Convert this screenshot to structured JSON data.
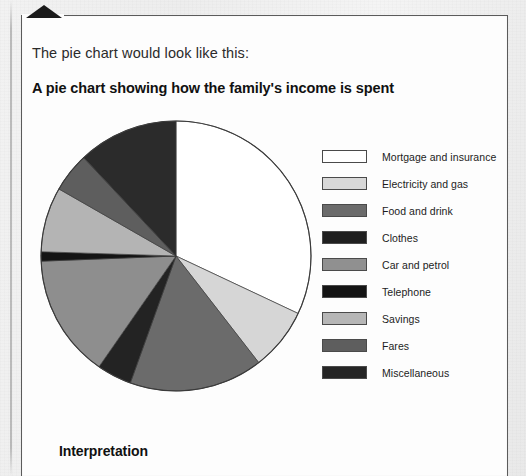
{
  "page": {
    "intro_line": "The pie chart would look like this:",
    "interpretation_heading": "Interpretation",
    "corner_marker": "page-corner-triangle",
    "ghost_text": [
      "a pie chart",
      "of the total",
      "to the size",
      "each sector",
      "the amounts",
      "is spent on",
      "given below"
    ]
  },
  "chart_data": {
    "type": "pie",
    "title": "A pie chart showing how the family's income is spent",
    "xlabel": "",
    "ylabel": "",
    "legend_position": "right",
    "grid": false,
    "start_angle_deg": 0,
    "direction": "clockwise",
    "categories": [
      "Mortgage and insurance",
      "Electricity and gas",
      "Food and drink",
      "Clothes",
      "Car and petrol",
      "Telephone",
      "Savings",
      "Fares",
      "Miscellaneous"
    ],
    "values": [
      32.0,
      7.5,
      16.0,
      4.2,
      14.7,
      1.1,
      7.8,
      4.7,
      12.0
    ],
    "units": "percent of income",
    "slices": [
      {
        "label": "Mortgage and insurance",
        "percent": 32.0,
        "angle_start_deg": 0,
        "angle_end_deg": 115.2,
        "color": "#ffffff"
      },
      {
        "label": "Electricity and gas",
        "percent": 7.5,
        "angle_start_deg": 115.2,
        "angle_end_deg": 142.2,
        "color": "#d6d6d6"
      },
      {
        "label": "Food and drink",
        "percent": 16.0,
        "angle_start_deg": 142.2,
        "angle_end_deg": 199.8,
        "color": "#6b6b6b"
      },
      {
        "label": "Clothes",
        "percent": 4.2,
        "angle_start_deg": 199.8,
        "angle_end_deg": 214.8,
        "color": "#232323"
      },
      {
        "label": "Car and petrol",
        "percent": 14.7,
        "angle_start_deg": 214.8,
        "angle_end_deg": 267.8,
        "color": "#8e8e8e"
      },
      {
        "label": "Telephone",
        "percent": 1.1,
        "angle_start_deg": 267.8,
        "angle_end_deg": 271.8,
        "color": "#141414"
      },
      {
        "label": "Savings",
        "percent": 7.8,
        "angle_start_deg": 271.8,
        "angle_end_deg": 299.8,
        "color": "#b4b4b4"
      },
      {
        "label": "Fares",
        "percent": 4.7,
        "angle_start_deg": 299.8,
        "angle_end_deg": 316.8,
        "color": "#5e5e5e"
      },
      {
        "label": "Miscellaneous",
        "percent": 12.0,
        "angle_start_deg": 316.8,
        "angle_end_deg": 360.0,
        "color": "#2b2b2b"
      }
    ],
    "geometry": {
      "cx": 136,
      "cy": 136,
      "r": 135
    }
  },
  "legend": {
    "items": [
      {
        "label": "Mortgage and insurance",
        "color": "#ffffff"
      },
      {
        "label": "Electricity and gas",
        "color": "#d8d8d8"
      },
      {
        "label": "Food and drink",
        "color": "#6b6b6b"
      },
      {
        "label": "Clothes",
        "color": "#1f1f1f"
      },
      {
        "label": "Car and petrol",
        "color": "#909090"
      },
      {
        "label": "Telephone",
        "color": "#141414"
      },
      {
        "label": "Savings",
        "color": "#b6b6b6"
      },
      {
        "label": "Fares",
        "color": "#5e5e5e"
      },
      {
        "label": "Miscellaneous",
        "color": "#252525"
      }
    ]
  }
}
